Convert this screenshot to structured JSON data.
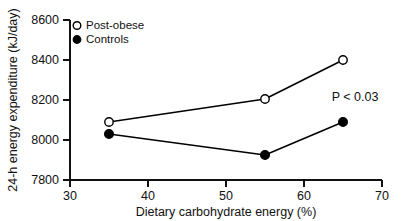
{
  "chart_data": {
    "type": "line",
    "title": "",
    "xlabel": "Dietary carbohydrate energy (%)",
    "ylabel": "24-h energy expenditure (kJ/day)",
    "xlim": [
      30,
      70
    ],
    "ylim": [
      7800,
      8600
    ],
    "xticks": [
      30,
      40,
      50,
      60,
      70
    ],
    "yticks": [
      7800,
      8000,
      8200,
      8400,
      8600
    ],
    "xtick_labels": [
      "30",
      "40",
      "50",
      "60",
      "70"
    ],
    "ytick_labels": [
      "7800",
      "8000",
      "8200",
      "8400",
      "8600"
    ],
    "grid": false,
    "legend_position": "top-left",
    "series": [
      {
        "name": "Post-obese",
        "marker": "open-circle",
        "x": [
          35,
          55,
          65
        ],
        "values": [
          8090,
          8205,
          8400
        ]
      },
      {
        "name": "Controls",
        "marker": "filled-circle",
        "x": [
          35,
          55,
          65
        ],
        "values": [
          8030,
          7925,
          8090
        ]
      }
    ],
    "annotations": [
      {
        "text": "P < 0.03",
        "x": 62.5,
        "y": 8180
      }
    ]
  },
  "legend": {
    "entries": [
      {
        "label": "Post-obese",
        "marker": "open-circle"
      },
      {
        "label": "Controls",
        "marker": "filled-circle"
      }
    ]
  },
  "axes": {
    "y_title": "24-h energy expenditure (kJ/day)",
    "x_title": "Dietary carbohydrate energy (%)",
    "y_tick_labels": [
      "8600",
      "8400",
      "8200",
      "8000",
      "7800"
    ],
    "x_tick_labels": [
      "30",
      "40",
      "50",
      "60",
      "70"
    ]
  },
  "annotation": {
    "p_value": "P < 0.03"
  }
}
